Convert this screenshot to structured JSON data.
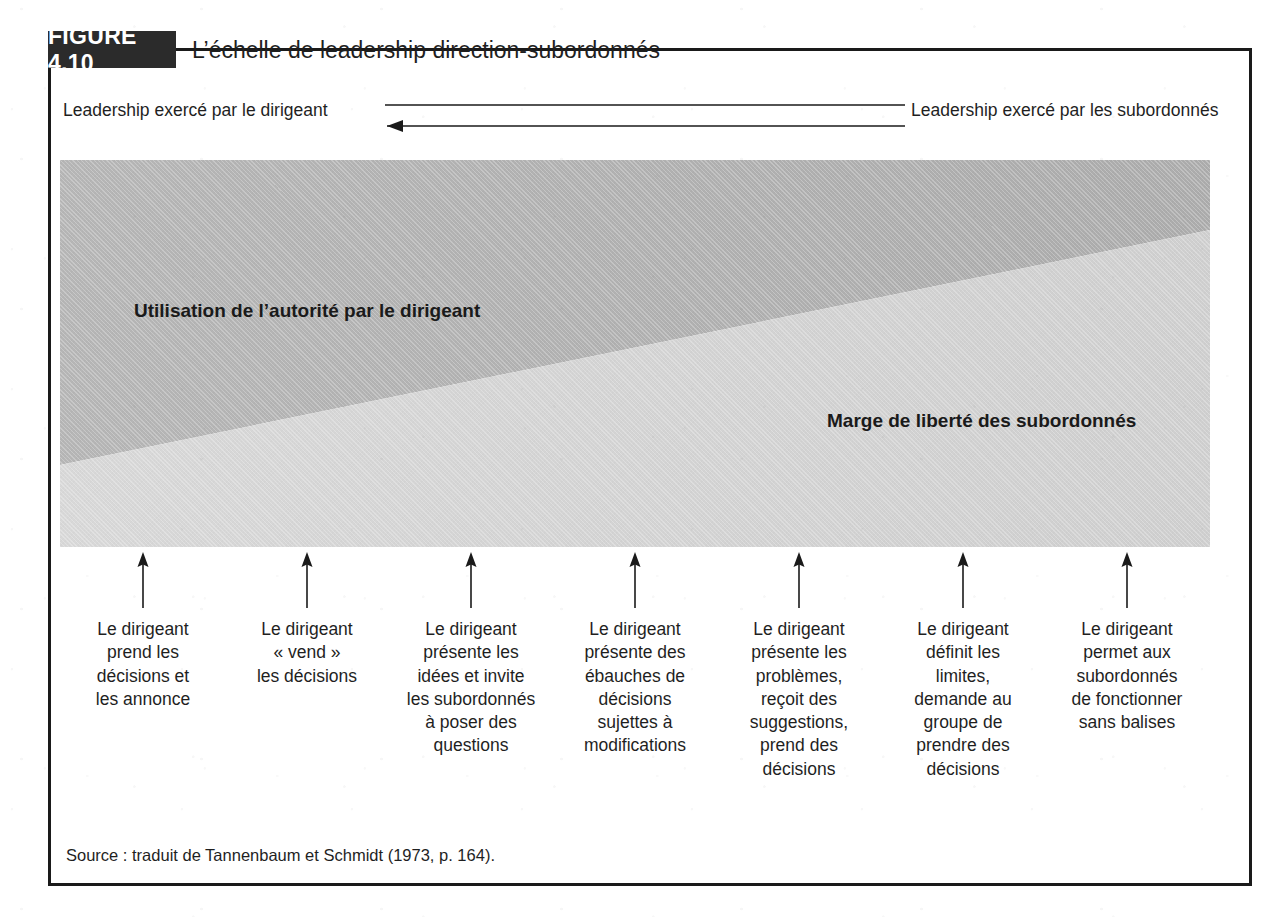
{
  "figure": {
    "badge": "FIGURE 4.10",
    "title": "L’échelle de leadership direction-subordonnés"
  },
  "axis_band": {
    "left_label": "Leadership exercé par le dirigeant",
    "right_label": "Leadership exercé par les subordonnés",
    "arrow_top_direction": "right",
    "arrow_bottom_direction": "left"
  },
  "panel": {
    "upper_region_label": "Utilisation de l’autorité par le dirigeant",
    "lower_region_label": "Marge de liberté des subordonnés",
    "upper_color": "#b3b3b3",
    "lower_color": "#d4d4d4"
  },
  "columns": [
    {
      "id": 1,
      "x": 143,
      "caption": "Le dirigeant\nprend les\ndécisions et\nles annonce"
    },
    {
      "id": 2,
      "x": 307,
      "caption": "Le dirigeant\n« vend »\nles décisions"
    },
    {
      "id": 3,
      "x": 471,
      "caption": "Le dirigeant\nprésente les\nidées et invite\nles subordonnés\nà poser des\nquestions"
    },
    {
      "id": 4,
      "x": 635,
      "caption": "Le dirigeant\nprésente des\nébauches de\ndécisions\nsujettes à\nmodifications"
    },
    {
      "id": 5,
      "x": 799,
      "caption": "Le dirigeant\nprésente les\nproblèmes,\nreçoit des\nsuggestions,\nprend des\ndécisions"
    },
    {
      "id": 6,
      "x": 963,
      "caption": "Le dirigeant\ndéfinit les\nlimites,\ndemande au\ngroupe de\nprendre des\ndécisions"
    },
    {
      "id": 7,
      "x": 1127,
      "caption": "Le dirigeant\npermet aux\nsubordonnés\nde fonctionner\nsans balises"
    }
  ],
  "source": {
    "text": "Source : traduit de Tannenbaum et Schmidt (1973, p. 164)."
  },
  "colors": {
    "ink": "#1a1a1a",
    "badge_bg": "#2b2b2b",
    "badge_text": "#ffffff"
  }
}
